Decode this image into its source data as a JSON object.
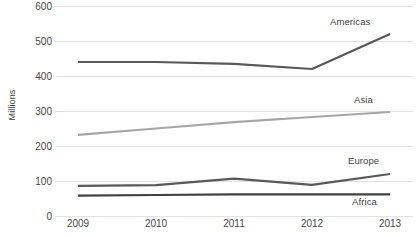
{
  "chart_data": {
    "type": "line",
    "title": "",
    "xlabel": "",
    "ylabel": "Millions",
    "categories": [
      "2009",
      "2010",
      "2011",
      "2012",
      "2013"
    ],
    "ylim": [
      0,
      600
    ],
    "yticks": [
      0,
      100,
      200,
      300,
      400,
      500,
      600
    ],
    "grid": true,
    "legend_position": "inline-right-of-series",
    "series": [
      {
        "name": "Americas",
        "color": "#595959",
        "values": [
          440,
          440,
          435,
          420,
          520
        ]
      },
      {
        "name": "Asia",
        "color": "#a6a6a6",
        "values": [
          232,
          250,
          268,
          283,
          297
        ]
      },
      {
        "name": "Europe",
        "color": "#595959",
        "values": [
          86,
          88,
          107,
          89,
          120
        ]
      },
      {
        "name": "Africa",
        "color": "#404040",
        "values": [
          58,
          60,
          62,
          62,
          62
        ]
      }
    ]
  },
  "axis": {
    "y_title": "Millions",
    "y_tick_labels": [
      "600",
      "500",
      "400",
      "300",
      "200",
      "100",
      "0"
    ],
    "x_tick_labels": [
      "2009",
      "2010",
      "2011",
      "2012",
      "2013"
    ]
  },
  "labels": {
    "americas": "Americas",
    "asia": "Asia",
    "europe": "Europe",
    "africa": "Africa"
  },
  "colors": {
    "gridline": "#e2e2e2",
    "text": "#4a4a4a",
    "background": "#ffffff"
  }
}
